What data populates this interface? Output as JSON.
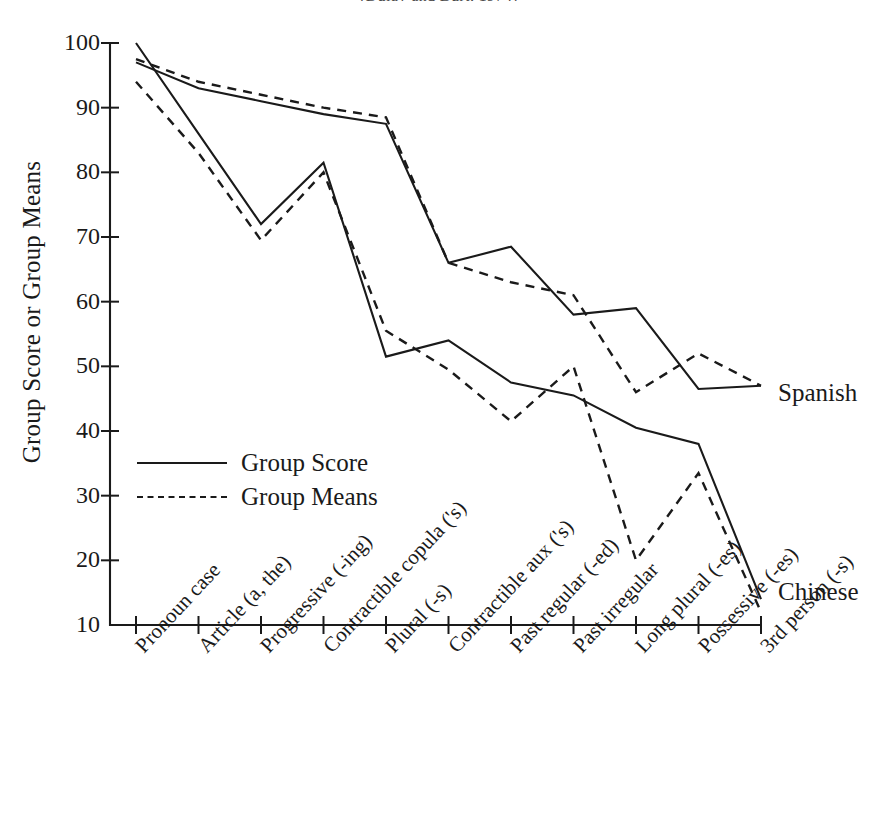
{
  "figure": {
    "title_remnant": "(Dulay and Burt, 1974)",
    "series_notes": {
      "upper": "Spanish",
      "lower": "Chinese"
    }
  },
  "legend": {
    "position": "inside-left",
    "entries": [
      {
        "label": "Group Score",
        "style": "solid"
      },
      {
        "label": "Group Means",
        "style": "dashed"
      }
    ]
  },
  "chart_data": {
    "type": "line",
    "title": "",
    "xlabel": "",
    "ylabel": "Group Score or Group Means",
    "ylim": [
      10,
      100
    ],
    "yticks": [
      10,
      20,
      30,
      40,
      50,
      60,
      70,
      80,
      90,
      100
    ],
    "grid": false,
    "legend_position": "inside-left",
    "categories": [
      "Pronoun case",
      "Article (a, the)",
      "Progressive (-ing)",
      "Contractible copula ('s)",
      "Plural (-s)",
      "Contractible aux ('s)",
      "Past regular (-ed)",
      "Past irregular",
      "Long plural (-es)",
      "Possessive (-es)",
      "3rd person (-s)"
    ],
    "annotations": [
      {
        "text": "Spanish",
        "at_category": "3rd person (-s)",
        "value": 47
      },
      {
        "text": "Chinese",
        "at_category": "3rd person (-s)",
        "value": 14
      }
    ],
    "series": [
      {
        "name": "Spanish Group Score",
        "group": "Spanish",
        "style": "solid",
        "values": [
          97,
          93,
          91,
          89,
          87.5,
          66,
          68.5,
          58,
          59,
          46.5,
          47
        ]
      },
      {
        "name": "Spanish Group Means",
        "group": "Spanish",
        "style": "dashed",
        "values": [
          97.5,
          94,
          92,
          90,
          88.5,
          66,
          63,
          61,
          46,
          52,
          47
        ]
      },
      {
        "name": "Chinese Group Score",
        "group": "Chinese",
        "style": "solid",
        "values": [
          100,
          86,
          72,
          81.5,
          51.5,
          54,
          47.5,
          45.5,
          40.5,
          38,
          14
        ]
      },
      {
        "name": "Chinese Group Means",
        "group": "Chinese",
        "style": "dashed",
        "values": [
          94,
          83,
          69.5,
          80,
          55.5,
          49.5,
          41.5,
          50,
          20,
          33.5,
          12
        ]
      }
    ]
  }
}
